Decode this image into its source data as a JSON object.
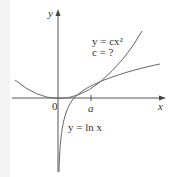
{
  "figure": {
    "axes": {
      "x_label": "x",
      "y_label": "y",
      "origin_label": "0",
      "tick_label": "a"
    },
    "curves": {
      "parabola": {
        "label_line1": "y = cx²",
        "label_line2": "c = ?"
      },
      "log": {
        "label": "y = ln x"
      }
    },
    "colors": {
      "axis": "#555555",
      "curve": "#666666",
      "text": "#333333"
    }
  }
}
